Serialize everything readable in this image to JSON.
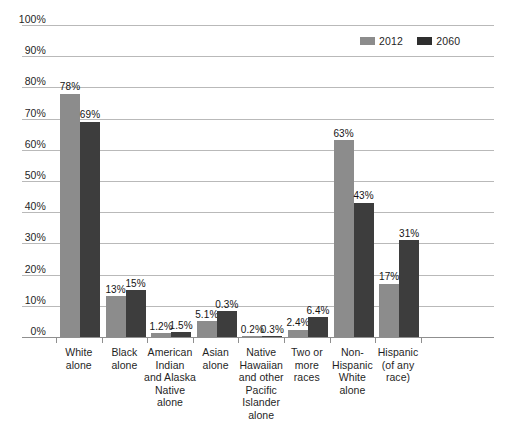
{
  "chart_data": {
    "type": "bar",
    "title": "",
    "subtitle": "",
    "xlabel": "",
    "ylabel": "",
    "ylim": [
      0,
      100
    ],
    "ytick_labels": [
      "100%",
      "90%",
      "80%",
      "70%",
      "60%",
      "50%",
      "40%",
      "30%",
      "20%",
      "10%",
      "0%"
    ],
    "ytick_values": [
      100,
      90,
      80,
      70,
      60,
      50,
      40,
      30,
      20,
      10,
      0
    ],
    "grid": true,
    "legend_position": "top-right",
    "categories": [
      "White\nalone",
      "Black\nalone",
      "American\nIndian\nand Alaska\nNative\nalone",
      "Asian\nalone",
      "Native\nHawaiian\nand other\nPacific\nIslander\nalone",
      "Two or\nmore\nraces",
      "Non-\nHispanic\nWhite\nalone",
      "Hispanic\n(of any\nrace)"
    ],
    "series": [
      {
        "name": "2012",
        "color": "#8c8c8c",
        "values": [
          78,
          13,
          1.2,
          5.1,
          0.2,
          2.4,
          63,
          17
        ],
        "labels": [
          "78%",
          "13%",
          "1.2%",
          "5.1%",
          "0.2%",
          "2.4%",
          "63%",
          "17%"
        ]
      },
      {
        "name": "2060",
        "color": "#3d3d3d",
        "values": [
          69,
          15,
          1.5,
          8.2,
          0.3,
          6.4,
          43,
          31
        ],
        "labels": [
          "69%",
          "15%",
          "1.5%",
          "0.3%",
          "0.3%",
          "6.4%",
          "43%",
          "31%"
        ]
      }
    ]
  },
  "legend": {
    "items": [
      {
        "label": "2012",
        "color": "#8c8c8c"
      },
      {
        "label": "2060",
        "color": "#2e2e2e"
      }
    ]
  }
}
